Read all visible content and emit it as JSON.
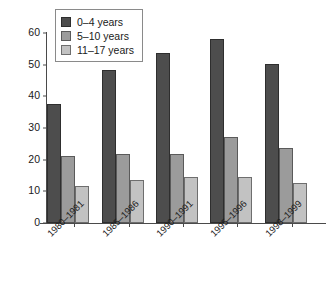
{
  "chart_data": {
    "type": "bar",
    "title": "",
    "xlabel": "",
    "ylabel": "Rate per 10,000 population",
    "categories": [
      "1980–1981",
      "1985–1986",
      "1990–1991",
      "1995–1996",
      "1998–1999"
    ],
    "series": [
      {
        "name": "0–4 years",
        "color": "#4d4d4d",
        "values": [
          37.6,
          48.3,
          53.7,
          58.1,
          50.2
        ]
      },
      {
        "name": "5–10 years",
        "color": "#9b9b9b",
        "values": [
          21.2,
          21.8,
          21.8,
          27.2,
          23.7
        ]
      },
      {
        "name": "11–17 years",
        "color": "#c2c2c2",
        "values": [
          11.7,
          13.6,
          14.5,
          14.5,
          12.6
        ]
      }
    ],
    "ylim": [
      0,
      60
    ],
    "yticks": [
      0,
      10,
      20,
      30,
      40,
      50,
      60
    ],
    "ytick_labels": [
      "0",
      "10",
      "20",
      "30",
      "40",
      "50",
      "60"
    ],
    "grid": false,
    "legend_position": "top-left"
  },
  "legend": {
    "items": [
      {
        "label": "0–4 years"
      },
      {
        "label": "5–10 years"
      },
      {
        "label": "11–17 years"
      }
    ]
  }
}
